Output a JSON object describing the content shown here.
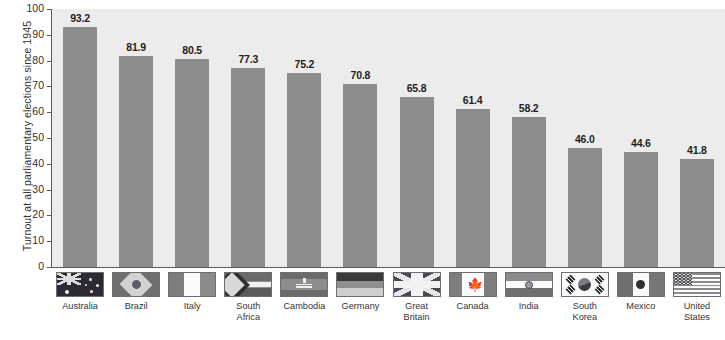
{
  "chart_data": {
    "type": "bar",
    "title": "",
    "subtitle": "",
    "xlabel": "",
    "ylabel": "Turnout at all parliamentary elections since 1945",
    "ylim": [
      0,
      100
    ],
    "yticks": [
      "0",
      "10",
      "20",
      "30",
      "40",
      "50",
      "60",
      "70",
      "80",
      "90",
      "100"
    ],
    "grid": false,
    "legend_position": "none",
    "bar_color": "#8c8c8c",
    "plot_background": "#ececed",
    "categories": [
      "Australia",
      "Brazil",
      "Italy",
      "South\nAfrica",
      "Cambodia",
      "Germany",
      "Great\nBritain",
      "Canada",
      "India",
      "South\nKorea",
      "Mexico",
      "United\nStates"
    ],
    "values": [
      93.2,
      81.9,
      80.5,
      77.3,
      75.2,
      70.8,
      65.8,
      61.4,
      58.2,
      46.0,
      44.6,
      41.8
    ],
    "value_labels": [
      "93.2",
      "81.9",
      "80.5",
      "77.3",
      "75.2",
      "70.8",
      "65.8",
      "61.4",
      "58.2",
      "46.0",
      "44.6",
      "41.8"
    ],
    "flag_icons": [
      "flag-australia-icon",
      "flag-brazil-icon",
      "flag-italy-icon",
      "flag-south-africa-icon",
      "flag-cambodia-icon",
      "flag-germany-icon",
      "flag-great-britain-icon",
      "flag-canada-icon",
      "flag-india-icon",
      "flag-south-korea-icon",
      "flag-mexico-icon",
      "flag-united-states-icon"
    ]
  }
}
